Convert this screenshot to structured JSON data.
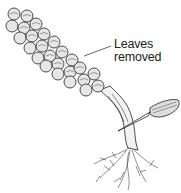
{
  "figure": {
    "callout": {
      "line1": "Leaves",
      "line2": "removed"
    },
    "colors": {
      "ink": "#222222",
      "background": "#ffffff",
      "sprout_fill": "#e6e6e6"
    }
  }
}
